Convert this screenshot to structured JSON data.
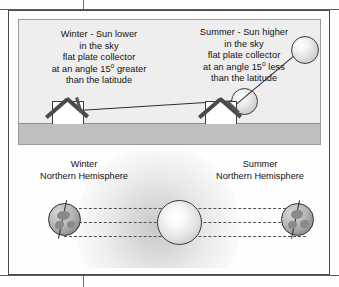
{
  "figure": {
    "top_panel": {
      "winter_caption": {
        "line1": "Winter - Sun lower",
        "line2": "in the sky",
        "line3": "flat plate collector",
        "line4_pre": "at an angle 15",
        "line4_sup": "o",
        "line4_post": " greater",
        "line5": "than the latitude"
      },
      "summer_caption": {
        "line1": "Summer - Sun higher",
        "line2": "in the sky",
        "line3": "flat plate collector",
        "line4_pre": "at an angle 15",
        "line4_sup": "o",
        "line4_post": " less",
        "line5": "than the latitude"
      },
      "elements": {
        "winter_sun": "sun",
        "summer_sun": "sun",
        "winter_house": "house with flat plate collector",
        "summer_house": "house with flat plate collector",
        "ground": "ground"
      }
    },
    "bottom_panel": {
      "winter_label": {
        "line1": "Winter",
        "line2": "Northern Hemisphere"
      },
      "summer_label": {
        "line1": "Summer",
        "line2": "Northern Hemisphere"
      },
      "elements": {
        "center_sun": "sun",
        "left_globe": "earth",
        "right_globe": "earth",
        "orbit_lines": "dotted sunlight rays"
      }
    }
  },
  "colors": {
    "panel_sky": "#eeeeee",
    "panel_ground": "#bfbfbf",
    "frame_border": "#4a4a4a",
    "text": "#111111",
    "ray": "#2d2d2d",
    "globe": "#8f8f8f"
  }
}
